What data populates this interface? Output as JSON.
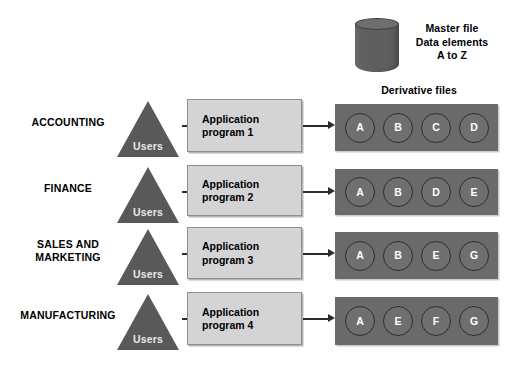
{
  "diagram": {
    "master_file": {
      "icon": "database-cylinder-icon",
      "label_line1": "Master file",
      "label_line2": "Data elements",
      "label_line3": "A to Z"
    },
    "derivative_files_label": "Derivative files",
    "users_label": "Users",
    "rows": [
      {
        "department": "ACCOUNTING",
        "department_lines": [
          "ACCOUNTING"
        ],
        "users": "Users",
        "program_line1": "Application",
        "program_line2": "program 1",
        "files": [
          "A",
          "B",
          "C",
          "D"
        ]
      },
      {
        "department": "FINANCE",
        "department_lines": [
          "FINANCE"
        ],
        "users": "Users",
        "program_line1": "Application",
        "program_line2": "program 2",
        "files": [
          "A",
          "B",
          "D",
          "E"
        ]
      },
      {
        "department": "SALES AND MARKETING",
        "department_lines": [
          "SALES AND",
          "MARKETING"
        ],
        "users": "Users",
        "program_line1": "Application",
        "program_line2": "program 3",
        "files": [
          "A",
          "B",
          "E",
          "G"
        ]
      },
      {
        "department": "MANUFACTURING",
        "department_lines": [
          "MANUFACTURING"
        ],
        "users": "Users",
        "program_line1": "Application",
        "program_line2": "program 4",
        "files": [
          "A",
          "E",
          "F",
          "G"
        ]
      }
    ]
  },
  "colors": {
    "background": "#ffffff",
    "triangle_fill": "#595959",
    "cylinder_fill": "#5f5f5f",
    "program_box_fill": "#d4d4d4",
    "program_box_border": "#8e8e8e",
    "files_box_fill": "#6a6a6a",
    "file_circle_fill": "#6f6f6f",
    "file_circle_border": "#2e2e2e",
    "text": "#000000",
    "arrow": "#2b2b2b"
  }
}
